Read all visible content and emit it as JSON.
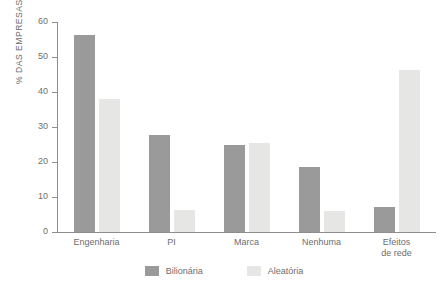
{
  "chart_data": {
    "type": "bar",
    "title": "",
    "xlabel": "",
    "ylabel": "% DAS EMPRESAS",
    "ylim": [
      0,
      60
    ],
    "yticks": [
      0,
      10,
      20,
      30,
      40,
      50,
      60
    ],
    "grid": false,
    "legend_position": "bottom",
    "categories": [
      "Engenharia",
      "PI",
      "Marca",
      "Nenhuma",
      "Efeitos\nde rede"
    ],
    "series": [
      {
        "name": "Bilionária",
        "color": "#999a99",
        "values": [
          56.3,
          27.8,
          24.9,
          18.5,
          7.2
        ]
      },
      {
        "name": "Aleatória",
        "color": "#e6e7e5",
        "values": [
          38.0,
          6.3,
          25.4,
          6.0,
          46.3
        ]
      }
    ]
  },
  "colors": {
    "axis": "#8d8d8d",
    "text": "#6e6e6e",
    "background": "#ffffff"
  }
}
